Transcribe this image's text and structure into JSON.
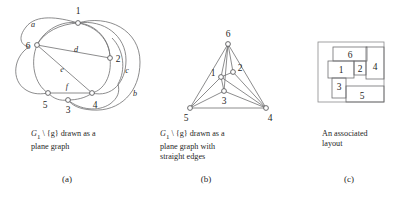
{
  "figure": {
    "panels": [
      {
        "id": "a",
        "letter": "(a)",
        "caption": "G1 \\ {g} drawn as a\nplane graph",
        "caption_prefix": "G",
        "caption_sub": "1",
        "caption_rest": " \\ {g} drawn as a\nplane graph",
        "vertex_labels": [
          "1",
          "2",
          "3",
          "4",
          "5",
          "6"
        ],
        "edge_labels": [
          "a",
          "b",
          "c",
          "d",
          "e",
          "f"
        ]
      },
      {
        "id": "b",
        "letter": "(b)",
        "caption": "G1 \\ {g} drawn as a\nplane graph with\nstraight edges",
        "caption_prefix": "G",
        "caption_sub": "1",
        "caption_rest": " \\ {g} drawn as a\nplane graph with\nstraight edges",
        "vertex_labels": [
          "1",
          "2",
          "3",
          "4",
          "5",
          "6"
        ]
      },
      {
        "id": "c",
        "letter": "(c)",
        "caption": "An associated\nlayout",
        "rect_labels": [
          "1",
          "2",
          "3",
          "4",
          "5",
          "6"
        ]
      }
    ]
  },
  "panel_a": {
    "vertices": [
      {
        "name": "1",
        "x": 78,
        "y": 23,
        "lx": 78,
        "ly": 12
      },
      {
        "name": "2",
        "x": 110,
        "y": 58,
        "lx": 118,
        "ly": 60
      },
      {
        "name": "3",
        "x": 68,
        "y": 100,
        "lx": 68,
        "ly": 113
      },
      {
        "name": "4",
        "x": 92,
        "y": 93,
        "lx": 94,
        "ly": 107
      },
      {
        "name": "5",
        "x": 48,
        "y": 93,
        "lx": 45,
        "ly": 107
      },
      {
        "name": "6",
        "x": 37,
        "y": 45,
        "lx": 27,
        "ly": 46
      }
    ],
    "edge_labels": [
      {
        "name": "a",
        "x": 33,
        "y": 24
      },
      {
        "name": "b",
        "x": 135,
        "y": 93
      },
      {
        "name": "c",
        "x": 128,
        "y": 70
      },
      {
        "name": "d",
        "x": 76,
        "y": 50
      },
      {
        "name": "e",
        "x": 63,
        "y": 70
      },
      {
        "name": "f",
        "x": 67,
        "y": 87
      }
    ]
  },
  "panel_b": {
    "vertices": [
      {
        "name": "6",
        "x": 228,
        "y": 44,
        "lx": 228,
        "ly": 34
      },
      {
        "name": "2",
        "x": 233,
        "y": 72,
        "lx": 240,
        "ly": 68
      },
      {
        "name": "1",
        "x": 221,
        "y": 77,
        "lx": 213,
        "ly": 73
      },
      {
        "name": "3",
        "x": 224,
        "y": 91,
        "lx": 224,
        "ly": 103
      },
      {
        "name": "5",
        "x": 190,
        "y": 108,
        "lx": 186,
        "ly": 120
      },
      {
        "name": "4",
        "x": 266,
        "y": 108,
        "lx": 270,
        "ly": 120
      }
    ],
    "edges": [
      [
        "6",
        "5"
      ],
      [
        "6",
        "4"
      ],
      [
        "6",
        "1"
      ],
      [
        "6",
        "2"
      ],
      [
        "6",
        "3"
      ],
      [
        "1",
        "2"
      ],
      [
        "1",
        "3"
      ],
      [
        "1",
        "5"
      ],
      [
        "1",
        "4"
      ],
      [
        "2",
        "4"
      ],
      [
        "3",
        "5"
      ],
      [
        "3",
        "4"
      ],
      [
        "5",
        "4"
      ]
    ]
  },
  "panel_c": {
    "rects": [
      {
        "name": "6",
        "x": 333,
        "y": 47,
        "w": 34,
        "h": 14,
        "lx": 350,
        "ly": 54
      },
      {
        "name": "1",
        "x": 328,
        "y": 61,
        "w": 26,
        "h": 17,
        "lx": 341,
        "ly": 70
      },
      {
        "name": "2",
        "x": 354,
        "y": 61,
        "w": 12,
        "h": 14,
        "lx": 360,
        "ly": 69
      },
      {
        "name": "4",
        "x": 366,
        "y": 47,
        "w": 18,
        "h": 32,
        "lx": 375,
        "ly": 70
      },
      {
        "name": "3",
        "x": 332,
        "y": 78,
        "w": 14,
        "h": 20,
        "lx": 339,
        "ly": 85
      },
      {
        "name": "5",
        "x": 346,
        "y": 86,
        "w": 38,
        "h": 16,
        "lx": 362,
        "ly": 96
      },
      {
        "name": "outer",
        "x": 318,
        "y": 42,
        "w": 66,
        "h": 60,
        "lx": 0,
        "ly": 0
      }
    ]
  },
  "style": {
    "stroke": "#6e6e70",
    "text": "#1f1f1f",
    "background": "#ffffff"
  }
}
